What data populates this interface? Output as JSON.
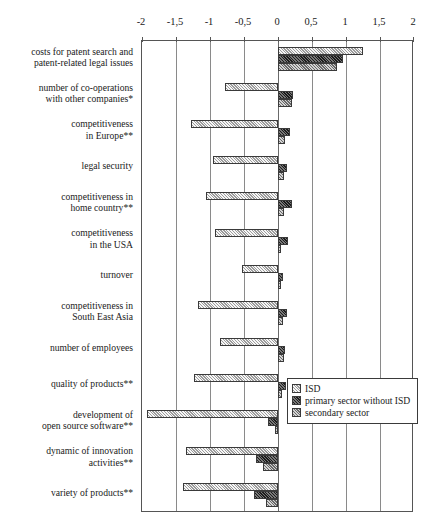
{
  "chart_data": {
    "type": "bar",
    "orientation": "horizontal",
    "title": "",
    "subtitle": "",
    "xlabel": "",
    "ylabel": "",
    "xlim": [
      -2,
      2
    ],
    "grid": true,
    "legend_position": "bottom-right",
    "decimal_separator": ",",
    "tick_labels": [
      "-2",
      "-1,5",
      "-1",
      "-0,5",
      "0",
      "0,5",
      "1",
      "1,5",
      "2"
    ],
    "tick_values": [
      -2,
      -1.5,
      -1,
      -0.5,
      0,
      0.5,
      1,
      1.5,
      2
    ],
    "categories": [
      "costs for patent search and patent-related legal issues",
      "number of co-operations with other companies*",
      "competitiveness in Europe**",
      "legal security",
      "competitiveness in home country**",
      "competitiveness in the USA",
      "turnover",
      "competitiveness in South East Asia",
      "number of employees",
      "quality of products**",
      "development of open source software**",
      "dynamic of innovation activities**",
      "variety of products**"
    ],
    "category_lines": [
      [
        "costs for patent search and",
        "patent-related legal issues"
      ],
      [
        "number of co-operations",
        "with other companies*"
      ],
      [
        "competitiveness",
        "in Europe**"
      ],
      [
        "legal security"
      ],
      [
        "competitiveness in",
        "home country**"
      ],
      [
        "competitiveness",
        "in the USA"
      ],
      [
        "turnover"
      ],
      [
        "competitiveness in",
        "South East Asia"
      ],
      [
        "number of employees"
      ],
      [
        "quality of products**"
      ],
      [
        "development of",
        "open source software**"
      ],
      [
        "dynamic of innovation",
        "activities**"
      ],
      [
        "variety of products**"
      ]
    ],
    "series": [
      {
        "name": "ISD",
        "color": "#c8c8c8",
        "values": [
          1.25,
          -0.78,
          -1.28,
          -0.95,
          -1.06,
          -0.92,
          -0.53,
          -1.17,
          -0.85,
          -1.23,
          -1.92,
          -1.35,
          -1.4
        ]
      },
      {
        "name": "primary sector without ISD",
        "color": "#3d3d3d",
        "values": [
          0.95,
          0.22,
          0.18,
          0.13,
          0.21,
          0.14,
          0.07,
          0.13,
          0.11,
          0.12,
          -0.15,
          -0.32,
          -0.36
        ]
      },
      {
        "name": "secondary sector",
        "color": "#9e9e9e",
        "values": [
          0.87,
          0.21,
          0.1,
          0.09,
          0.09,
          0.05,
          0.04,
          0.07,
          0.09,
          0.06,
          -0.04,
          -0.22,
          -0.17
        ]
      }
    ]
  },
  "legend": {
    "items": [
      {
        "label": "ISD"
      },
      {
        "label": "primary sector without ISD"
      },
      {
        "label": "secondary sector"
      }
    ]
  }
}
